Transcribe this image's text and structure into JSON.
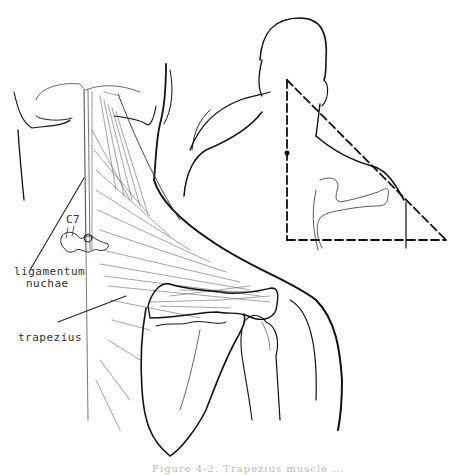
{
  "figure": {
    "labels": {
      "c7": "C7",
      "ligamentum_line1": "ligamentum",
      "ligamentum_line2": "nuchae",
      "trapezius": "trapezius"
    },
    "caption": "Figure 4-2. Trapezius muscle ...",
    "colors": {
      "ink": "#111111",
      "muscle_hatch": "#555555",
      "background": "#ffffff"
    }
  }
}
